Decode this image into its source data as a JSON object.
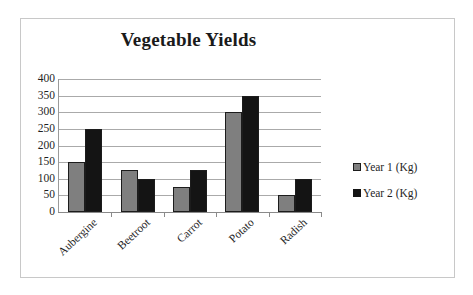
{
  "chart_data": {
    "type": "bar",
    "title": "Vegetable Yields",
    "xlabel": "",
    "ylabel": "",
    "ylim": [
      0,
      400
    ],
    "ytick_labels": [
      "400",
      "350",
      "300",
      "250",
      "200",
      "150",
      "100",
      "50",
      "0"
    ],
    "yticks": [
      400,
      350,
      300,
      250,
      200,
      150,
      100,
      50,
      0
    ],
    "grid": true,
    "legend_position": "right",
    "categories": [
      "Aubergine",
      "Beetroot",
      "Carrot",
      "Potato",
      "Radish"
    ],
    "series": [
      {
        "name": "Year 1 (Kg)",
        "color": "#7f7f7f",
        "values": [
          150,
          125,
          75,
          300,
          50
        ]
      },
      {
        "name": "Year 2 (Kg)",
        "color": "#141414",
        "values": [
          250,
          100,
          125,
          350,
          100
        ]
      }
    ]
  },
  "legend": {
    "entries": [
      {
        "label": "Year 1 (Kg)",
        "marker": "square-marker-gray"
      },
      {
        "label": "Year 2 (Kg)",
        "marker": "square-marker-black"
      }
    ]
  }
}
